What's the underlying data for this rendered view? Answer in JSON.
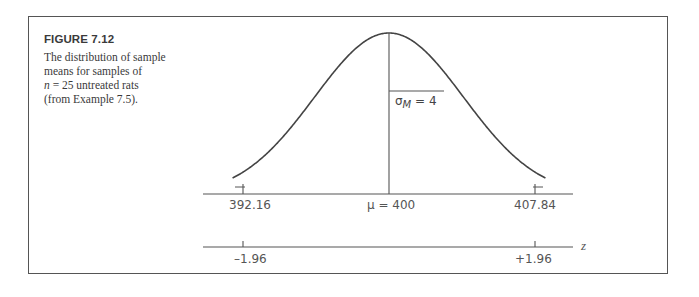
{
  "figure": {
    "title": "FIGURE 7.12",
    "caption_line1": "The distribution of sample",
    "caption_line2": "means for samples of",
    "caption_n_var": "n",
    "caption_n_rest": " = 25 untreated rats",
    "caption_line4": "(from Example 7.5)."
  },
  "labels": {
    "sigma_symbol": "σ",
    "sigma_subscript": "M",
    "sigma_value": " = 4",
    "mean_label": "μ = 400",
    "left_value": "392.16",
    "right_value": "407.84",
    "z_left": "–1.96",
    "z_right": "+1.96",
    "z_axis_label": "z"
  },
  "chart_data": {
    "type": "line",
    "title": "FIGURE 7.12",
    "distribution": "normal",
    "mean": 400,
    "standard_error": 4,
    "x_ticks": [
      392.16,
      400,
      407.84
    ],
    "x_tick_labels": [
      "392.16",
      "μ = 400",
      "407.84"
    ],
    "z_ticks": [
      -1.96,
      1.96
    ],
    "z_tick_labels": [
      "–1.96",
      "+1.96"
    ],
    "annotations": [
      "σM = 4"
    ],
    "xlabel": "",
    "z_axis_label": "z",
    "grid": false
  },
  "colors": {
    "stroke": "#444444",
    "border": "#555555",
    "text": "#555555"
  }
}
